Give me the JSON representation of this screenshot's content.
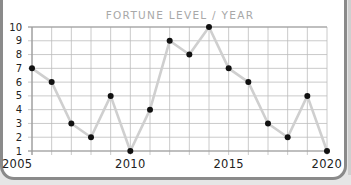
{
  "chart_data": {
    "type": "line",
    "title": "FORTUNE LEVEL / YEAR",
    "xlabel": "",
    "ylabel": "",
    "x": [
      2005,
      2006,
      2007,
      2008,
      2009,
      2010,
      2011,
      2012,
      2013,
      2014,
      2015,
      2016,
      2017,
      2018,
      2019,
      2020
    ],
    "series": [
      {
        "name": "Fortune level",
        "values": [
          7,
          6,
          3,
          2,
          5,
          1,
          4,
          9,
          8,
          10,
          7,
          6,
          3,
          2,
          5,
          1
        ]
      }
    ],
    "xlim": [
      2005,
      2020
    ],
    "ylim": [
      1,
      10
    ],
    "x_tick_labels": [
      "2005",
      "2010",
      "2015",
      "2020"
    ],
    "y_tick_labels": [
      "1",
      "2",
      "3",
      "4",
      "5",
      "6",
      "7",
      "8",
      "9",
      "10"
    ],
    "grid": true,
    "legend": "none",
    "colors": {
      "line": "#cfcfcf",
      "marker": "#111111",
      "grid": "#bdbdbd",
      "title": "#a8a8a8"
    }
  }
}
